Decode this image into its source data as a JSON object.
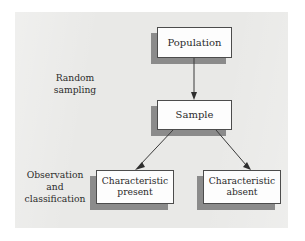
{
  "figure": {
    "type": "flow-diagram",
    "background_color": "#ffffff",
    "panel_color": "#e9e9e7",
    "box_fill_color": "#fdfdfd",
    "box_border_color": "#4c4c4c",
    "shadow_color": "#8b8b8b",
    "text_color": "#2b2b2b",
    "arrow_color": "#3a3a3a"
  },
  "nodes": {
    "population": {
      "label": "Population"
    },
    "sample": {
      "label": "Sample"
    },
    "characteristic_present": {
      "line1": "Characteristic",
      "line2": "present"
    },
    "characteristic_absent": {
      "line1": "Characteristic",
      "line2": "absent"
    }
  },
  "side_labels": {
    "random_sampling": {
      "line1": "Random",
      "line2": "sampling"
    },
    "observation_classification": {
      "line1": "Observation",
      "line2": "and",
      "line3": "classification"
    }
  },
  "edges": [
    {
      "from": "population",
      "to": "sample",
      "label": "Random sampling",
      "style": "straight-down-arrow"
    },
    {
      "from": "sample",
      "to": "characteristic_present",
      "label": "Observation and classification",
      "style": "diagonal-left-arrow"
    },
    {
      "from": "sample",
      "to": "characteristic_absent",
      "label": "Observation and classification",
      "style": "diagonal-right-arrow"
    }
  ]
}
